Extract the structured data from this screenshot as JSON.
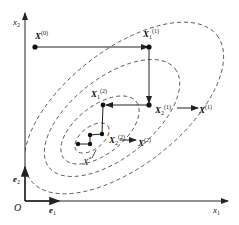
{
  "axes": {
    "x_label": "x",
    "x_sub": "1",
    "y_label": "x",
    "y_sub": "2",
    "origin": "O",
    "e1_label": "e",
    "e1_sub": "1",
    "e2_label": "e",
    "e2_sub": "2"
  },
  "points": {
    "x0": {
      "label": "X",
      "sup": "(0)"
    },
    "x1_1": {
      "label": "X",
      "sub": "1",
      "sup": "(1)"
    },
    "x2_1": {
      "label": "X",
      "sub": "2",
      "sup": "(1)"
    },
    "x1_arrow": {
      "label": "X",
      "sup": "(1)"
    },
    "x1_2": {
      "label": "X",
      "sub": "1",
      "sup": "(2)"
    },
    "x2_2": {
      "label": "X",
      "sub": "2",
      "sup": "(2)"
    },
    "x2_arrow": {
      "label": "X",
      "sup": "(2)"
    },
    "xstar": {
      "label": "X",
      "sup": "*"
    }
  },
  "colors": {
    "line": "#222222",
    "contour": "#555555"
  }
}
